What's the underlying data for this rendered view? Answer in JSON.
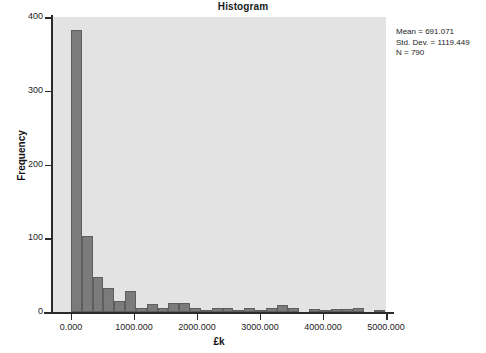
{
  "chart_data": {
    "type": "bar",
    "title": "Histogram",
    "xlabel": "£k",
    "ylabel": "Frequency",
    "xlim": [
      -300,
      5000
    ],
    "ylim": [
      0,
      400
    ],
    "grid": false,
    "legend": null,
    "bin_width": 172,
    "x_ticks": [
      0,
      1000,
      2000,
      3000,
      4000,
      5000
    ],
    "x_tick_labels": [
      "0.000",
      "1000.000",
      "2000.000",
      "3000.000",
      "4000.000",
      "5000.000"
    ],
    "y_ticks": [
      0,
      100,
      200,
      300,
      400
    ],
    "y_tick_labels": [
      "0",
      "100",
      "200",
      "300",
      "400"
    ],
    "bin_starts": [
      0,
      172,
      344,
      516,
      688,
      860,
      1032,
      1204,
      1376,
      1548,
      1720,
      1892,
      2064,
      2236,
      2408,
      2580,
      2752,
      2924,
      3096,
      3268,
      3440,
      3612,
      3784,
      3956,
      4128,
      4300,
      4472,
      4644,
      4816
    ],
    "values": [
      382,
      103,
      47,
      33,
      15,
      28,
      5,
      11,
      5,
      12,
      12,
      5,
      2,
      6,
      6,
      1,
      6,
      2,
      5,
      9,
      6,
      0,
      4,
      1,
      4,
      4,
      5,
      0,
      2
    ],
    "annotations": {
      "mean_label": "Mean = 691.071",
      "std_dev_label": "Std. Dev. = 1119.449",
      "n_label": "N = 790"
    },
    "colors": {
      "bar_fill": "#7b7b7b",
      "bar_border": "#5e5e5e",
      "panel_background": "#e3e3e3",
      "axis": "#2b2b2b",
      "text": "#1c1c1c"
    }
  }
}
